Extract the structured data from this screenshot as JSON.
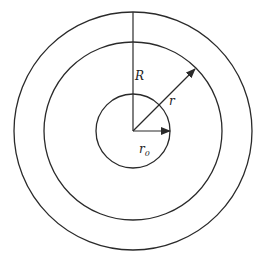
{
  "diagram": {
    "type": "concentric-circles",
    "center": [
      133,
      131
    ],
    "stroke_color": "#2a2a2a",
    "circles": [
      {
        "name": "outer",
        "radius": 119
      },
      {
        "name": "middle",
        "radius": 89
      },
      {
        "name": "inner",
        "radius": 37
      }
    ],
    "labels": {
      "R": "R",
      "r": "r",
      "r0_main": "r",
      "r0_sub": "0"
    }
  }
}
